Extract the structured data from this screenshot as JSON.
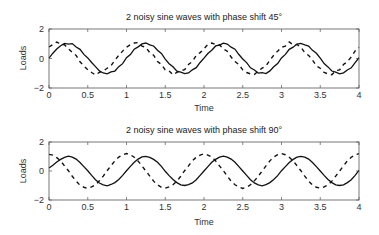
{
  "chart_data": [
    {
      "type": "line",
      "title": "2 noisy sine waves with phase shift 45°",
      "xlabel": "Time",
      "ylabel": "Loads",
      "xlim": [
        0,
        4
      ],
      "ylim": [
        -2,
        2
      ],
      "xticks": [
        0,
        0.5,
        1,
        1.5,
        2,
        2.5,
        3,
        3.5,
        4
      ],
      "xtick_labels": [
        "0",
        "0.5",
        "1",
        "1.5",
        "2",
        "2.5",
        "3",
        "3.5",
        "4"
      ],
      "yticks": [
        -2,
        0,
        2
      ],
      "ytick_labels": [
        "−2",
        "0",
        "2"
      ],
      "grid": false,
      "x_step": 0.05,
      "series": [
        {
          "name": "sine (0°)",
          "style": "solid",
          "values": [
            0.02,
            0.36,
            0.64,
            0.86,
            1.02,
            0.97,
            1.01,
            0.78,
            0.62,
            0.28,
            0.04,
            -0.27,
            -0.55,
            -0.84,
            -0.98,
            -1.04,
            -0.91,
            -0.85,
            -0.55,
            -0.35,
            0.05,
            0.27,
            0.63,
            0.79,
            0.99,
            1.05,
            0.92,
            0.85,
            0.56,
            0.34,
            -0.04,
            -0.35,
            -0.56,
            -0.86,
            -0.92,
            -1.03,
            -0.98,
            -0.77,
            -0.62,
            -0.27,
            0.03,
            0.34,
            0.56,
            0.85,
            0.91,
            1.04,
            0.98,
            0.77,
            0.63,
            0.27,
            -0.03,
            -0.28,
            -0.63,
            -0.78,
            -0.99,
            -0.96,
            -1.02,
            -0.84,
            -0.56,
            -0.34,
            0.04,
            0.28,
            0.62,
            0.77,
            0.98,
            1.03,
            0.93,
            0.84,
            0.55,
            0.35,
            0.02,
            -0.34,
            -0.57,
            -0.85,
            -0.92,
            -1.04,
            -0.97,
            -0.78,
            -0.63,
            -0.28,
            0.05
          ]
        },
        {
          "name": "sine (45° shift)",
          "style": "dashed",
          "values": [
            0.78,
            0.95,
            1.12,
            0.96,
            0.93,
            0.66,
            0.41,
            0.21,
            -0.22,
            -0.5,
            -0.76,
            -0.95,
            -1.12,
            -0.94,
            -0.85,
            -0.66,
            -0.49,
            -0.12,
            0.21,
            0.5,
            0.77,
            0.93,
            1.05,
            1.08,
            0.84,
            0.76,
            0.4,
            0.22,
            -0.2,
            -0.4,
            -0.77,
            -0.84,
            -1.1,
            -0.94,
            -0.83,
            -0.76,
            -0.4,
            -0.2,
            0.2,
            0.4,
            0.66,
            0.95,
            1.05,
            0.94,
            0.93,
            0.65,
            0.49,
            0.1,
            -0.21,
            -0.41,
            -0.77,
            -0.95,
            -1.04,
            -1.08,
            -0.84,
            -0.65,
            -0.51,
            -0.11,
            0.22,
            0.5,
            0.76,
            0.84,
            1.12,
            0.93,
            0.95,
            0.76,
            0.4,
            0.21,
            -0.1,
            -0.5,
            -0.66,
            -0.95,
            -1.04,
            -1.1,
            -0.83,
            -0.77,
            -0.41,
            -0.21,
            0.1,
            0.51,
            0.77
          ]
        }
      ]
    },
    {
      "type": "line",
      "title": "2 noisy sine waves with phase shift 90°",
      "xlabel": "Time",
      "ylabel": "Loads",
      "xlim": [
        0,
        4
      ],
      "ylim": [
        -2,
        2
      ],
      "xticks": [
        0,
        0.5,
        1,
        1.5,
        2,
        2.5,
        3,
        3.5,
        4
      ],
      "xtick_labels": [
        "0",
        "0.5",
        "1",
        "1.5",
        "2",
        "2.5",
        "3",
        "3.5",
        "4"
      ],
      "yticks": [
        -2,
        0,
        2
      ],
      "ytick_labels": [
        "−2",
        "0",
        "2"
      ],
      "grid": false,
      "x_step": 0.05,
      "series": [
        {
          "name": "sine (0°)",
          "style": "solid",
          "values": [
            0.2,
            0.4,
            0.62,
            0.8,
            0.94,
            1.02,
            0.96,
            0.82,
            0.58,
            0.3,
            0.02,
            -0.3,
            -0.6,
            -0.83,
            -0.95,
            -1.02,
            -0.93,
            -0.8,
            -0.58,
            -0.3,
            0.02,
            0.32,
            0.6,
            0.82,
            0.97,
            1.01,
            0.94,
            0.8,
            0.6,
            0.32,
            -0.02,
            -0.32,
            -0.58,
            -0.8,
            -0.96,
            -1.0,
            -0.94,
            -0.82,
            -0.6,
            -0.3,
            0.0,
            0.3,
            0.6,
            0.8,
            0.95,
            1.02,
            0.96,
            0.82,
            0.6,
            0.3,
            0.0,
            -0.3,
            -0.6,
            -0.82,
            -0.96,
            -1.02,
            -0.94,
            -0.8,
            -0.58,
            -0.32,
            0.02,
            0.3,
            0.58,
            0.8,
            0.96,
            1.01,
            0.95,
            0.82,
            0.58,
            0.3,
            0.0,
            -0.3,
            -0.58,
            -0.8,
            -0.95,
            -1.0,
            -0.95,
            -0.8,
            -0.6,
            -0.3,
            0.05
          ]
        },
        {
          "name": "sine (90° shift)",
          "style": "dashed",
          "values": [
            1.15,
            1.1,
            0.92,
            0.7,
            0.35,
            0.02,
            -0.36,
            -0.7,
            -0.98,
            -1.12,
            -1.2,
            -1.1,
            -0.95,
            -0.68,
            -0.35,
            0.02,
            0.37,
            0.7,
            0.96,
            1.12,
            1.2,
            1.12,
            0.95,
            0.68,
            0.35,
            0.0,
            -0.35,
            -0.7,
            -0.95,
            -1.12,
            -1.18,
            -1.1,
            -0.95,
            -0.7,
            -0.36,
            0.02,
            0.35,
            0.7,
            0.95,
            1.1,
            1.18,
            1.1,
            0.96,
            0.7,
            0.35,
            0.02,
            -0.36,
            -0.7,
            -0.95,
            -1.1,
            -1.2,
            -1.12,
            -0.95,
            -0.68,
            -0.36,
            0.0,
            0.35,
            0.7,
            0.96,
            1.12,
            1.2,
            1.12,
            0.95,
            0.7,
            0.36,
            0.02,
            -0.35,
            -0.7,
            -0.96,
            -1.12,
            -1.18,
            -1.1,
            -0.96,
            -0.7,
            -0.35,
            0.0,
            0.36,
            0.7,
            0.95,
            1.12,
            1.2
          ]
        }
      ]
    }
  ]
}
